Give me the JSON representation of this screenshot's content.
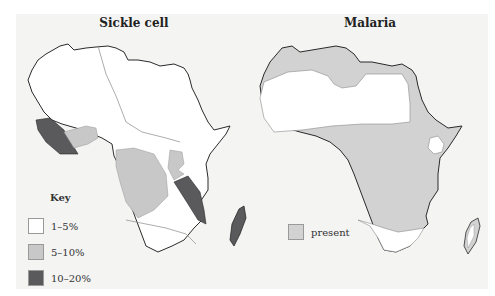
{
  "maps": [
    {
      "title": "Sickle cell",
      "key": {
        "title": "Key",
        "items": [
          {
            "label": "1–5%",
            "color": "#ffffff"
          },
          {
            "label": "5–10%",
            "color": "#c8c8c8"
          },
          {
            "label": "10–20%",
            "color": "#5a5a5c"
          }
        ]
      }
    },
    {
      "title": "Malaria",
      "key": {
        "items": [
          {
            "label": "present",
            "color": "#d2d2d2"
          }
        ]
      }
    }
  ],
  "colors": {
    "background": "#f4f4f3",
    "outline": "#2a2a2a",
    "boundary": "#8a8a8a"
  }
}
